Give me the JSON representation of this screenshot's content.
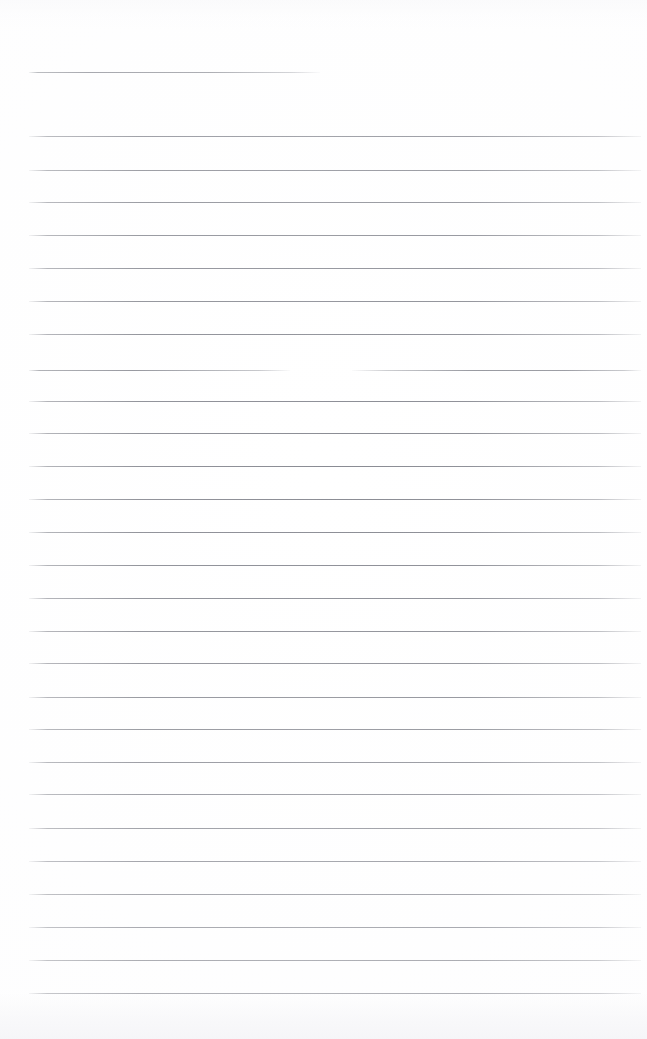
{
  "document": {
    "kind": "scanned-ruled-notebook-page",
    "title": "",
    "written_text": "",
    "page_width": 647,
    "page_height": 1039,
    "background_color": "#ffffff",
    "rule_color": "#767880",
    "rule_thickness_px": 1,
    "rule_spacing_px": 32.7,
    "left_margin_x": 29,
    "right_margin_x": 641,
    "rule_count": 29,
    "notes": "Blank ruled page; no handwriting, no printed text, no header or page number visible."
  },
  "rules": [
    {
      "id": "rule-01",
      "y": 72,
      "segments": [
        {
          "x": 29,
          "width": 291,
          "style": "short"
        }
      ]
    },
    {
      "id": "rule-02",
      "y": 136,
      "segments": [
        {
          "x": 29,
          "width": 612,
          "style": "full"
        }
      ]
    },
    {
      "id": "rule-03",
      "y": 170,
      "segments": [
        {
          "x": 29,
          "width": 612,
          "style": "full"
        }
      ]
    },
    {
      "id": "rule-04",
      "y": 202,
      "segments": [
        {
          "x": 29,
          "width": 612,
          "style": "full"
        }
      ]
    },
    {
      "id": "rule-05",
      "y": 235,
      "segments": [
        {
          "x": 29,
          "width": 612,
          "style": "full"
        }
      ]
    },
    {
      "id": "rule-06",
      "y": 268,
      "segments": [
        {
          "x": 29,
          "width": 612,
          "style": "full"
        }
      ]
    },
    {
      "id": "rule-07",
      "y": 301,
      "segments": [
        {
          "x": 29,
          "width": 612,
          "style": "full"
        }
      ]
    },
    {
      "id": "rule-08",
      "y": 334,
      "segments": [
        {
          "x": 29,
          "width": 612,
          "style": "full"
        }
      ]
    },
    {
      "id": "rule-09",
      "y": 370,
      "segments": [
        {
          "x": 29,
          "width": 261,
          "style": "left"
        },
        {
          "x": 352,
          "width": 289,
          "style": "right"
        }
      ]
    },
    {
      "id": "rule-10",
      "y": 401,
      "segments": [
        {
          "x": 29,
          "width": 612,
          "style": "full"
        }
      ]
    },
    {
      "id": "rule-11",
      "y": 433,
      "segments": [
        {
          "x": 29,
          "width": 612,
          "style": "full"
        }
      ]
    },
    {
      "id": "rule-12",
      "y": 466,
      "segments": [
        {
          "x": 29,
          "width": 612,
          "style": "full"
        }
      ]
    },
    {
      "id": "rule-13",
      "y": 499,
      "segments": [
        {
          "x": 29,
          "width": 612,
          "style": "full"
        }
      ]
    },
    {
      "id": "rule-14",
      "y": 532,
      "segments": [
        {
          "x": 29,
          "width": 612,
          "style": "full"
        }
      ]
    },
    {
      "id": "rule-15",
      "y": 565,
      "segments": [
        {
          "x": 29,
          "width": 612,
          "style": "full"
        }
      ]
    },
    {
      "id": "rule-16",
      "y": 598,
      "segments": [
        {
          "x": 29,
          "width": 612,
          "style": "full"
        }
      ]
    },
    {
      "id": "rule-17",
      "y": 631,
      "segments": [
        {
          "x": 29,
          "width": 612,
          "style": "full"
        }
      ]
    },
    {
      "id": "rule-18",
      "y": 663,
      "segments": [
        {
          "x": 29,
          "width": 612,
          "style": "full"
        }
      ]
    },
    {
      "id": "rule-19",
      "y": 697,
      "segments": [
        {
          "x": 29,
          "width": 612,
          "style": "full"
        }
      ]
    },
    {
      "id": "rule-20",
      "y": 729,
      "segments": [
        {
          "x": 29,
          "width": 612,
          "style": "full"
        }
      ]
    },
    {
      "id": "rule-21",
      "y": 762,
      "segments": [
        {
          "x": 29,
          "width": 612,
          "style": "full"
        }
      ]
    },
    {
      "id": "rule-22",
      "y": 794,
      "segments": [
        {
          "x": 29,
          "width": 612,
          "style": "full"
        }
      ]
    },
    {
      "id": "rule-23",
      "y": 828,
      "segments": [
        {
          "x": 29,
          "width": 612,
          "style": "full"
        }
      ]
    },
    {
      "id": "rule-24",
      "y": 861,
      "segments": [
        {
          "x": 29,
          "width": 612,
          "style": "full"
        }
      ]
    },
    {
      "id": "rule-25",
      "y": 894,
      "segments": [
        {
          "x": 29,
          "width": 612,
          "style": "full"
        }
      ]
    },
    {
      "id": "rule-26",
      "y": 927,
      "segments": [
        {
          "x": 29,
          "width": 612,
          "style": "full"
        }
      ]
    },
    {
      "id": "rule-27",
      "y": 960,
      "segments": [
        {
          "x": 29,
          "width": 612,
          "style": "full"
        }
      ]
    },
    {
      "id": "rule-28",
      "y": 993,
      "segments": [
        {
          "x": 29,
          "width": 612,
          "style": "full"
        }
      ]
    }
  ]
}
